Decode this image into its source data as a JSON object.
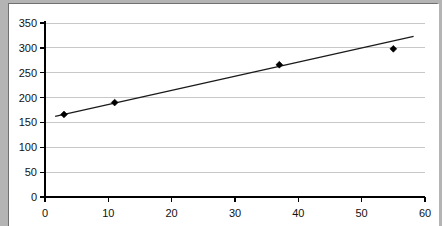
{
  "chart_data": {
    "type": "scatter",
    "title": "",
    "subtitle": "",
    "xlabel": "",
    "ylabel": "",
    "xlim": [
      0,
      60
    ],
    "ylim": [
      0,
      350
    ],
    "grid": "horizontal",
    "legend": "none",
    "x_ticks": [
      0,
      10,
      20,
      30,
      40,
      50,
      60
    ],
    "y_ticks": [
      0,
      50,
      100,
      150,
      200,
      250,
      300,
      350
    ],
    "x_tick_labels": [
      "0",
      "10",
      "20",
      "30",
      "40",
      "50",
      "60"
    ],
    "y_tick_labels": [
      "0",
      "50",
      "100",
      "150",
      "200",
      "250",
      "300",
      "350"
    ],
    "series": [
      {
        "name": "data-points",
        "type": "scatter",
        "marker": "diamond",
        "color": "#000000",
        "points": [
          {
            "x": 3,
            "y": 166
          },
          {
            "x": 11,
            "y": 190
          },
          {
            "x": 37,
            "y": 266
          },
          {
            "x": 55,
            "y": 298
          }
        ]
      },
      {
        "name": "trendline",
        "type": "line",
        "color": "#1a1a1a",
        "points": [
          {
            "x": 1.6,
            "y": 162
          },
          {
            "x": 58.2,
            "y": 323
          }
        ]
      }
    ]
  },
  "colors": {
    "background": "#b4b4b4",
    "plot_background": "#ffffff",
    "gridline": "#c8c8c8",
    "axis": "#000000",
    "marker": "#000000",
    "trendline": "#1a1a1a"
  }
}
